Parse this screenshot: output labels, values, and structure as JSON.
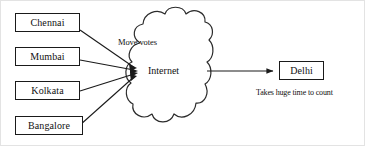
{
  "diagram": {
    "type": "network-flow-diagram",
    "canvas": {
      "width": 365,
      "height": 146
    },
    "colors": {
      "stroke": "#1a1a1a",
      "text": "#111111",
      "background": "#ffffff",
      "frame": "#e3e3e3"
    },
    "source_nodes": [
      {
        "id": "chennai",
        "label": "Chennai"
      },
      {
        "id": "mumbai",
        "label": "Mumbai"
      },
      {
        "id": "kolkata",
        "label": "Kolkata"
      },
      {
        "id": "bangalore",
        "label": "Bangalore"
      }
    ],
    "cloud": {
      "id": "internet",
      "label": "Internet"
    },
    "destination_node": {
      "id": "delhi",
      "label": "Delhi"
    },
    "edge_labels": {
      "inbound": "Move votes"
    },
    "captions": {
      "destination_note": "Takes huge time to count"
    }
  }
}
